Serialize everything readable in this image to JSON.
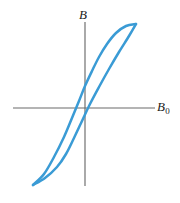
{
  "figure": {
    "background_color": "#ffffff"
  },
  "axes": {
    "vertical": {
      "label": "B",
      "label_subscript": "",
      "color": "#6b6b6b",
      "x_px": 85,
      "y_start_px": 22,
      "y_end_px": 186
    },
    "horizontal": {
      "label": "B",
      "label_subscript": "0",
      "color": "#6b6b6b",
      "y_px": 108,
      "x_start_px": 13,
      "x_end_px": 155
    }
  },
  "chart_data": {
    "type": "line",
    "xlabel": "B_0",
    "ylabel": "B",
    "grid": false,
    "legend": null,
    "curve_color": "#3a9bd5",
    "xlim": [
      -1,
      1
    ],
    "ylim": [
      -1,
      1
    ],
    "annotations": [],
    "series": [
      {
        "name": "ascending-branch",
        "description": "Lower branch traced while the applied field increases; crosses the B axis below the origin and the B_0 axis to the right of the origin.",
        "points_px": [
          [
            33,
            185
          ],
          [
            45,
            178
          ],
          [
            57,
            167
          ],
          [
            66,
            154
          ],
          [
            74,
            138
          ],
          [
            82,
            121
          ],
          [
            90,
            104
          ],
          [
            99,
            87
          ],
          [
            109,
            69
          ],
          [
            119,
            52
          ],
          [
            129,
            36
          ],
          [
            136,
            24
          ]
        ]
      },
      {
        "name": "descending-branch",
        "description": "Upper branch traced while the applied field decreases; crosses the B axis above the origin and the B_0 axis to the left of the origin.",
        "points_px": [
          [
            136,
            24
          ],
          [
            126,
            26
          ],
          [
            116,
            33
          ],
          [
            107,
            44
          ],
          [
            99,
            57
          ],
          [
            92,
            71
          ],
          [
            85,
            86
          ],
          [
            79,
            101
          ],
          [
            72,
            118
          ],
          [
            64,
            137
          ],
          [
            54,
            157
          ],
          [
            44,
            174
          ],
          [
            33,
            185
          ]
        ]
      }
    ],
    "crossings_px": {
      "ascending_crosses_horizontal_axis_at_x": 93,
      "descending_crosses_horizontal_axis_at_x": 77,
      "ascending_crosses_vertical_axis_at_y": 132,
      "descending_crosses_vertical_axis_at_y": 82,
      "upper_tip": [
        136,
        24
      ],
      "lower_tip": [
        33,
        185
      ]
    }
  }
}
